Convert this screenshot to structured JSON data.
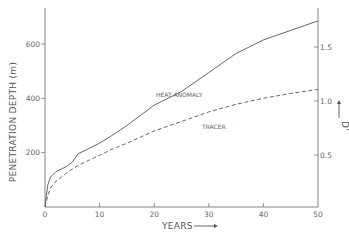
{
  "chart_data": {
    "type": "line",
    "title": "",
    "xlabel": "YEARS",
    "ylabel": "PENETRATION DEPTH (m)",
    "y2label": "D'",
    "xlim": [
      0,
      50
    ],
    "ylim": [
      0,
      730
    ],
    "y2lim": [
      0,
      1.92
    ],
    "x_ticks": [
      0,
      10,
      20,
      30,
      40,
      50
    ],
    "y_ticks": [
      200,
      400,
      600
    ],
    "y2_ticks": [
      0.5,
      1.0,
      1.5
    ],
    "grid": false,
    "legend": "inline labels",
    "series": [
      {
        "name": "HEAT ANOMALY",
        "style": "solid",
        "x": [
          0,
          0.5,
          1,
          2,
          3,
          4,
          5,
          6,
          8,
          10,
          12,
          15,
          18,
          20,
          25,
          30,
          35,
          40,
          45,
          50
        ],
        "values": [
          0,
          80,
          110,
          130,
          140,
          150,
          165,
          195,
          215,
          235,
          260,
          300,
          345,
          375,
          425,
          495,
          565,
          615,
          650,
          685
        ]
      },
      {
        "name": "TRACER",
        "style": "dashed",
        "x": [
          0,
          0.5,
          1,
          2,
          3,
          4,
          5,
          6,
          8,
          10,
          12,
          15,
          18,
          20,
          25,
          30,
          35,
          40,
          45,
          50
        ],
        "values": [
          0,
          40,
          70,
          95,
          110,
          125,
          140,
          152,
          172,
          190,
          210,
          235,
          262,
          280,
          315,
          350,
          378,
          400,
          418,
          433
        ]
      }
    ]
  },
  "labels": {
    "xlabel": "YEARS",
    "ylabel": "PENETRATION DEPTH  (m)",
    "y2label": "D'",
    "heat": "HEAT ANOMALY",
    "tracer": "TRACER",
    "x_ticks": [
      "0",
      "10",
      "20",
      "30",
      "40",
      "50"
    ],
    "y_ticks": [
      "200",
      "400",
      "600"
    ],
    "y2_ticks": [
      "0.5",
      "1.0",
      "1.5"
    ]
  }
}
